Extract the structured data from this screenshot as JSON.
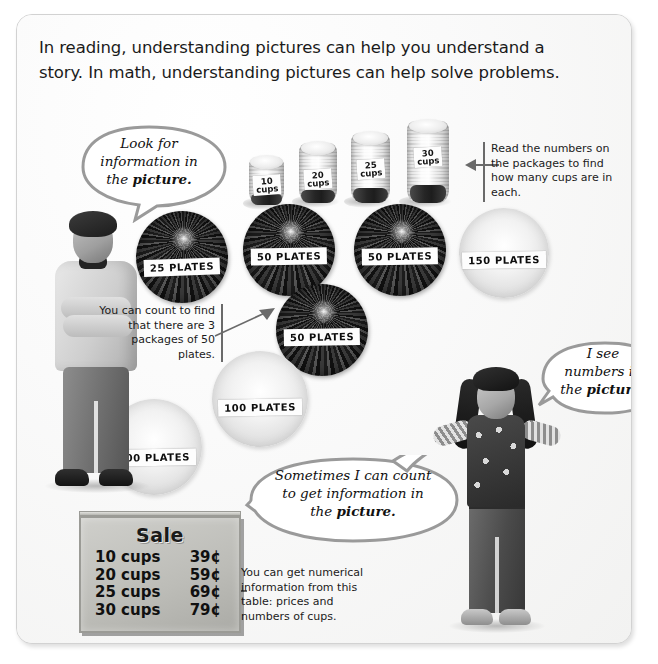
{
  "page": {
    "intro_paragraph": "In reading, understanding pictures can help you understand a story. In math, understanding pictures can help solve problems."
  },
  "bubbles": [
    {
      "id": "look-for-information",
      "line1": "Look for",
      "line2": "information in",
      "line3_prefix": "the ",
      "line3_bold": "picture."
    },
    {
      "id": "i-see-numbers",
      "line1": "I see",
      "line2": "numbers in",
      "line3_prefix": "the ",
      "line3_bold": "picture."
    },
    {
      "id": "sometimes-i-can-count",
      "line1": "Sometimes I can count",
      "line2": "to get information in",
      "line3_prefix": "the ",
      "line3_bold": "picture."
    }
  ],
  "callouts": {
    "read_numbers": "Read the numbers on the packages to find how many cups are in each.",
    "count_packages": "You can count to find that there are 3 packages of 50 plates.",
    "numerical_table": "You can get numerical information from this table: prices and numbers of cups."
  },
  "cups": [
    {
      "count": "10",
      "unit": "cups",
      "label": "10\ncups"
    },
    {
      "count": "20",
      "unit": "cups",
      "label": "20\ncups"
    },
    {
      "count": "25",
      "unit": "cups",
      "label": "25\ncups"
    },
    {
      "count": "30",
      "unit": "cups",
      "label": "30\ncups"
    }
  ],
  "plates": [
    {
      "id": "plate-25",
      "label": "25 PLATES",
      "tone": "dark"
    },
    {
      "id": "plate-50-a",
      "label": "50 PLATES",
      "tone": "dark"
    },
    {
      "id": "plate-50-b",
      "label": "50 PLATES",
      "tone": "dark"
    },
    {
      "id": "plate-150",
      "label": "150 PLATES",
      "tone": "light"
    },
    {
      "id": "plate-50-c",
      "label": "50 PLATES",
      "tone": "dark"
    },
    {
      "id": "plate-100-a",
      "label": "100 PLATES",
      "tone": "light"
    },
    {
      "id": "plate-100-b",
      "label": "100 PLATES",
      "tone": "light"
    }
  ],
  "sale_sign": {
    "title": "Sale",
    "rows": [
      {
        "item": "10 cups",
        "price": "39¢"
      },
      {
        "item": "20 cups",
        "price": "59¢"
      },
      {
        "item": "25 cups",
        "price": "69¢"
      },
      {
        "item": "30 cups",
        "price": "79¢"
      }
    ]
  },
  "colors": {
    "page_background": "#ffffff",
    "panel_background": "#f7f7f6",
    "panel_border": "#d2d2d2",
    "bubble_outline": "#9a9a9a",
    "callout_rule": "#6a6a6a",
    "text": "#1b1b1b",
    "sale_sign": "#bcbcb7"
  }
}
